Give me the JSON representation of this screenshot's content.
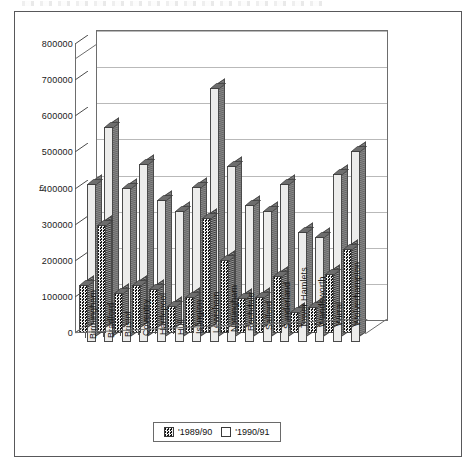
{
  "figure": {
    "ylabel": "£",
    "legend": [
      {
        "name": "'1989/90",
        "swatch": "dark-checker"
      },
      {
        "name": "'1990/91",
        "swatch": "white"
      }
    ]
  },
  "chart_data": {
    "type": "bar",
    "title": "",
    "xlabel": "",
    "ylabel": "£",
    "ylim": [
      0,
      800000
    ],
    "yticks": [
      0,
      100000,
      200000,
      300000,
      400000,
      500000,
      600000,
      700000,
      800000
    ],
    "ytick_labels": [
      "0",
      "100000",
      "200000",
      "300000",
      "400000",
      "500000",
      "600000",
      "700000",
      "800000"
    ],
    "grid": true,
    "style": "3d-clustered-column",
    "legend_position": "bottom-center",
    "categories": [
      "Birmingham",
      "Bradford",
      "Bristol",
      "Coventry",
      "Hartlepool",
      "Hull",
      "Islington",
      "Lewisham",
      "Nottingham",
      "Rochdale",
      "Salford",
      "Sunderland",
      "Tower Hamlets",
      "Wandsworth",
      "Wirral",
      "Wolverhampton"
    ],
    "series": [
      {
        "name": "'1989/90",
        "fill": "dark-checker",
        "values": [
          133000,
          300000,
          110000,
          133000,
          122000,
          75000,
          100000,
          317000,
          203000,
          97000,
          100000,
          158000,
          58000,
          72000,
          164000,
          233000
        ]
      },
      {
        "name": "'1990/91",
        "fill": "white",
        "values": [
          437000,
          595000,
          425000,
          494000,
          392000,
          364000,
          428000,
          703000,
          486000,
          378000,
          364000,
          437000,
          305000,
          292000,
          464000,
          528000
        ]
      }
    ]
  }
}
